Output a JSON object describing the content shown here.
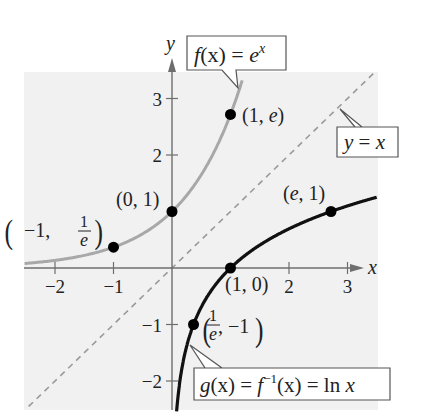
{
  "figure": {
    "axes": {
      "x_label": "x",
      "y_label": "y",
      "x_ticks": [
        {
          "value": -2,
          "label": "−2"
        },
        {
          "value": -1,
          "label": "−1"
        },
        {
          "value": 2,
          "label": "2"
        },
        {
          "value": 3,
          "label": "3"
        }
      ],
      "y_ticks": [
        {
          "value": 3,
          "label": "3"
        },
        {
          "value": 2,
          "label": "2"
        },
        {
          "value": -1,
          "label": "−1"
        },
        {
          "value": -2,
          "label": "−2"
        }
      ],
      "x_range": [
        -2.5,
        3.5
      ],
      "y_range": [
        -2.5,
        3.5
      ]
    },
    "curves": [
      {
        "id": "f",
        "name": "f(x) = e^x",
        "color": "#a8a8a8",
        "style": "solid"
      },
      {
        "id": "g",
        "name": "g(x) = f^{-1}(x) = ln x",
        "color": "#111111",
        "style": "solid"
      },
      {
        "id": "identity",
        "name": "y = x",
        "color": "#9a9a9a",
        "style": "dashed"
      }
    ],
    "callouts": {
      "f": {
        "prefix": "f",
        "paren": "(x) = ",
        "base": "e",
        "exp": "x"
      },
      "identity": {
        "text_y": "y",
        "eq": " = ",
        "text_x": "x"
      },
      "g": {
        "g": "g",
        "p1": "(x) = ",
        "f": "f",
        "sup": "−1",
        "p2": "(x) = ln ",
        "x": "x"
      }
    },
    "points": [
      {
        "curve": "f",
        "x": -1,
        "y": 0.3679,
        "label_a": "−1,",
        "label_frac_num": "1",
        "label_frac_den": "e"
      },
      {
        "curve": "f",
        "x": 0,
        "y": 1,
        "label": "(0, 1)"
      },
      {
        "curve": "f",
        "x": 1,
        "y": 2.718,
        "label_pre": "(1, ",
        "label_e": "e",
        "label_post": ")"
      },
      {
        "curve": "g",
        "x": 0.3679,
        "y": -1,
        "label_frac_num": "1",
        "label_frac_den": "e",
        "label_b": ", −1"
      },
      {
        "curve": "g",
        "x": 1,
        "y": 0,
        "label": "(1, 0)"
      },
      {
        "curve": "g",
        "x": 2.718,
        "y": 1,
        "label_pre": "(",
        "label_e": "e",
        "label_post": ", 1)"
      }
    ],
    "colors": {
      "background_panel": "#f1f1f1",
      "axis": "#6e6e6e",
      "f_curve": "#a8a8a8",
      "g_curve": "#111111",
      "identity": "#9a9a9a"
    }
  },
  "chart_data": {
    "type": "line",
    "title": "",
    "xlabel": "x",
    "ylabel": "y",
    "xlim": [
      -2.5,
      3.5
    ],
    "ylim": [
      -2.5,
      3.5
    ],
    "grid": false,
    "series": [
      {
        "name": "f(x) = e^x",
        "expr": "exp(x)",
        "x": [
          -2.5,
          -2,
          -1,
          0,
          0.5,
          1,
          1.2
        ],
        "values": [
          0.082,
          0.135,
          0.368,
          1,
          1.649,
          2.718,
          3.32
        ]
      },
      {
        "name": "g(x) = ln x",
        "expr": "ln(x)",
        "x": [
          0.08,
          0.135,
          0.368,
          1,
          2,
          2.718,
          3.5
        ],
        "values": [
          -2.5,
          -2,
          -1,
          0,
          0.693,
          1,
          1.253
        ]
      },
      {
        "name": "y = x",
        "expr": "x",
        "x": [
          -2.5,
          3.5
        ],
        "values": [
          -2.5,
          3.5
        ]
      }
    ],
    "labeled_points": [
      {
        "label": "(−1, 1/e)",
        "x": -1,
        "y": 0.368
      },
      {
        "label": "(0, 1)",
        "x": 0,
        "y": 1
      },
      {
        "label": "(1, e)",
        "x": 1,
        "y": 2.718
      },
      {
        "label": "(1/e, −1)",
        "x": 0.368,
        "y": -1
      },
      {
        "label": "(1, 0)",
        "x": 1,
        "y": 0
      },
      {
        "label": "(e, 1)",
        "x": 2.718,
        "y": 1
      }
    ],
    "x_ticks": [
      -2,
      -1,
      2,
      3
    ],
    "y_ticks": [
      -2,
      -1,
      2,
      3
    ],
    "legend": "callout boxes"
  }
}
